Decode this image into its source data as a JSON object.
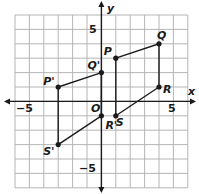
{
  "diagram": {
    "title": "",
    "axes": {
      "x_label": "x",
      "y_label": "y",
      "origin_label": "O",
      "xlim": [
        -6,
        6
      ],
      "ylim": [
        -6,
        6
      ],
      "tick_labels": {
        "x_neg": "−5",
        "x_pos": "5",
        "y_pos": "5",
        "y_neg": "−5"
      }
    },
    "grid": {
      "on": true,
      "spacing": 1
    },
    "figures": [
      {
        "name": "PQRS",
        "vertices": [
          {
            "label": "P",
            "x": 1,
            "y": 3
          },
          {
            "label": "Q",
            "x": 4,
            "y": 4
          },
          {
            "label": "R",
            "x": 4,
            "y": 1
          },
          {
            "label": "S",
            "x": 1,
            "y": -1
          }
        ]
      },
      {
        "name": "P'Q'R'S'",
        "vertices": [
          {
            "label": "P'",
            "x": -3,
            "y": 1
          },
          {
            "label": "Q'",
            "x": 0,
            "y": 2
          },
          {
            "label": "R'",
            "x": 0,
            "y": -1
          },
          {
            "label": "S'",
            "x": -3,
            "y": -3
          }
        ]
      }
    ],
    "colors": {
      "grid": "#b5b5b5",
      "axis": "#1a1a1a",
      "line": "#1a1a1a",
      "point": "#1a1a1a"
    }
  }
}
